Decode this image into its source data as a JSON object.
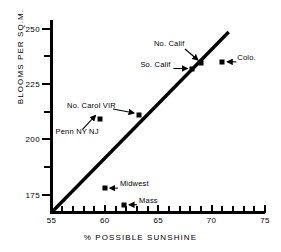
{
  "chart_data": {
    "type": "scatter",
    "title": "",
    "xlabel": "% POSSIBLE SUNSHINE",
    "ylabel": "BLOOMS PER SQ.M.",
    "xlim": [
      55,
      75
    ],
    "ylim": [
      167,
      253
    ],
    "grid": false,
    "legend": "none",
    "x_ticks_major": [
      55,
      60,
      65,
      70,
      75
    ],
    "x_tick_labels": [
      "55",
      "60",
      "65",
      "70",
      "75"
    ],
    "x_ticks_minor": [
      56,
      57,
      58,
      59,
      61,
      62,
      63,
      64,
      66,
      67,
      68,
      69,
      71,
      72,
      73,
      74
    ],
    "y_ticks_major": [
      175,
      200,
      225,
      250
    ],
    "y_tick_labels": [
      "175",
      "200",
      "225",
      "250"
    ],
    "y_ticks_minor": [
      187.5,
      212.5,
      237.5
    ],
    "points": [
      {
        "name": "Penn NY NJ",
        "x": 59.5,
        "y": 209.0,
        "label": "Penn NY  NJ",
        "label_pos": "below-left",
        "arrow": true
      },
      {
        "name": "No. Carol VIR",
        "x": 63.2,
        "y": 211.0,
        "label": "No. Carol VIR",
        "label_pos": "left",
        "arrow": true
      },
      {
        "name": "So. Calif",
        "x": 68.2,
        "y": 232.0,
        "label": "So. Calif",
        "label_pos": "left",
        "arrow": true
      },
      {
        "name": "No. Calif",
        "x": 69.0,
        "y": 234.5,
        "label": "No. Calif",
        "label_pos": "above-left",
        "arrow": true
      },
      {
        "name": "Colo.",
        "x": 71.0,
        "y": 235.0,
        "label": "Colo.",
        "label_pos": "right",
        "arrow": true
      },
      {
        "name": "Midwest",
        "x": 60.0,
        "y": 178.0,
        "label": "Midwest",
        "label_pos": "right",
        "arrow": true
      },
      {
        "name": "Mass",
        "x": 61.8,
        "y": 170.5,
        "label": "Mass",
        "label_pos": "right",
        "arrow": true
      }
    ],
    "trendline": {
      "type": "line",
      "x_start": 55.0,
      "y_start": 167.0,
      "x_end": 71.6,
      "y_end": 248.5
    }
  }
}
